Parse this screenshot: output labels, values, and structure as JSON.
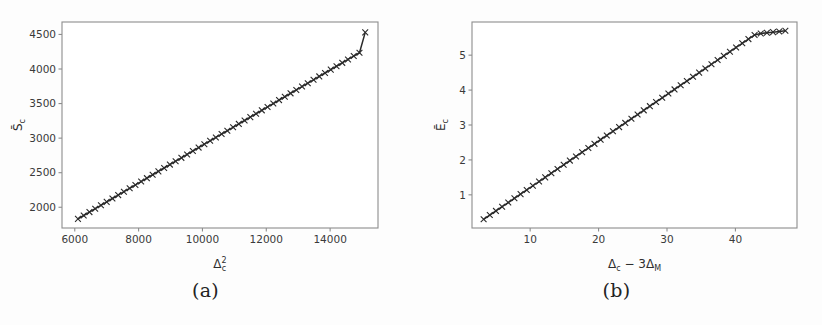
{
  "figure": {
    "background_color": "#fdfdfd",
    "line_color": "#2a2a2a",
    "axis_color": "#8d8d8d",
    "marker": "x"
  },
  "panels": [
    {
      "caption": "(a)",
      "chart_data": {
        "type": "line",
        "title": "",
        "xlabel": "Δ²c",
        "xlabel_base": "Δ",
        "xlabel_sup": "2",
        "xlabel_sub": "c",
        "ylabel": "S̄c",
        "ylabel_base": "S̄",
        "ylabel_sub": "c",
        "xlim": [
          5600,
          15500
        ],
        "ylim": [
          1700,
          4680
        ],
        "xticks": [
          6000,
          8000,
          10000,
          12000,
          14000
        ],
        "yticks": [
          2000,
          2500,
          3000,
          3500,
          4000,
          4500
        ],
        "xtick_labels": [
          "6000",
          "8000",
          "10000",
          "12000",
          "14000"
        ],
        "ytick_labels": [
          "2000",
          "2500",
          "3000",
          "3500",
          "4000",
          "4500"
        ],
        "grid": false,
        "legend": "none",
        "series": [
          {
            "name": "S̄c vs Δ²c",
            "marker": "x",
            "x": [
              6100,
              6280,
              6460,
              6640,
              6820,
              7000,
              7180,
              7360,
              7540,
              7720,
              7900,
              8080,
              8260,
              8440,
              8620,
              8800,
              8980,
              9160,
              9340,
              9520,
              9700,
              9880,
              10060,
              10240,
              10420,
              10600,
              10780,
              10960,
              11140,
              11320,
              11500,
              11680,
              11860,
              12040,
              12220,
              12400,
              12580,
              12760,
              12940,
              13120,
              13300,
              13480,
              13660,
              13840,
              14020,
              14200,
              14380,
              14560,
              14740,
              14920,
              15100
            ],
            "y": [
              1832,
              1881,
              1930,
              1979,
              2028,
              2078,
              2127,
              2176,
              2225,
              2274,
              2323,
              2372,
              2421,
              2470,
              2519,
              2568,
              2617,
              2666,
              2715,
              2764,
              2814,
              2863,
              2912,
              2961,
              3010,
              3059,
              3108,
              3157,
              3206,
              3255,
              3304,
              3353,
              3402,
              3451,
              3500,
              3550,
              3599,
              3648,
              3697,
              3746,
              3795,
              3844,
              3893,
              3942,
              3991,
              4040,
              4089,
              4138,
              4187,
              4236,
              4530
            ]
          }
        ]
      }
    },
    {
      "caption": "(b)",
      "chart_data": {
        "type": "line",
        "title": "",
        "xlabel": "Δc − 3ΔM",
        "xlabel_parts": [
          "Δ",
          "c",
          " − 3",
          "Δ",
          "M"
        ],
        "ylabel": "Ēc",
        "ylabel_base": "Ē",
        "ylabel_sub": "c",
        "xlim": [
          1.5,
          49
        ],
        "ylim": [
          0.05,
          5.95
        ],
        "xticks": [
          10,
          20,
          30,
          40
        ],
        "yticks": [
          1,
          2,
          3,
          4,
          5
        ],
        "xtick_labels": [
          "10",
          "20",
          "30",
          "40"
        ],
        "ytick_labels": [
          "1",
          "2",
          "3",
          "4",
          "5"
        ],
        "grid": false,
        "legend": "none",
        "series": [
          {
            "name": "Ēc vs Δc − 3ΔM",
            "marker": "x",
            "x": [
              3.2,
              4.1,
              5.0,
              5.9,
              6.8,
              7.7,
              8.6,
              9.5,
              10.4,
              11.3,
              12.2,
              13.1,
              14.0,
              14.9,
              15.8,
              16.7,
              17.6,
              18.5,
              19.4,
              20.3,
              21.2,
              22.1,
              23.0,
              23.9,
              24.8,
              25.7,
              26.6,
              27.5,
              28.4,
              29.3,
              30.2,
              31.1,
              32.0,
              32.9,
              33.8,
              34.7,
              35.6,
              36.5,
              37.4,
              38.3,
              39.2,
              40.1,
              41.0,
              41.9,
              42.8,
              43.7,
              44.6,
              45.5,
              46.4,
              47.3
            ],
            "y": [
              0.3,
              0.42,
              0.54,
              0.66,
              0.78,
              0.9,
              1.02,
              1.14,
              1.26,
              1.38,
              1.5,
              1.62,
              1.74,
              1.86,
              1.98,
              2.1,
              2.22,
              2.34,
              2.46,
              2.58,
              2.7,
              2.82,
              2.94,
              3.06,
              3.18,
              3.3,
              3.42,
              3.54,
              3.66,
              3.78,
              3.9,
              4.02,
              4.14,
              4.26,
              4.38,
              4.5,
              4.62,
              4.74,
              4.86,
              4.98,
              5.1,
              5.22,
              5.34,
              5.46,
              5.58,
              5.62,
              5.64,
              5.66,
              5.68,
              5.7
            ]
          }
        ]
      }
    }
  ]
}
